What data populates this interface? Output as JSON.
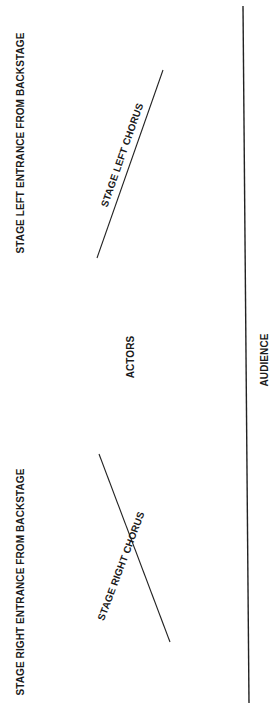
{
  "diagram": {
    "type": "stage-layout",
    "labels": {
      "stage_left_entrance": "STAGE LEFT ENTRANCE FROM BACKSTAGE",
      "stage_right_entrance": "STAGE RIGHT ENTRANCE FROM BACKSTAGE",
      "stage_left_chorus": "STAGE LEFT CHORUS",
      "stage_right_chorus": "STAGE RIGHT CHORUS",
      "actors": "ACTORS",
      "audience": "AUDIENCE"
    },
    "colors": {
      "text": "#1a1a1a",
      "line": "#222222",
      "background": "#ffffff"
    }
  }
}
